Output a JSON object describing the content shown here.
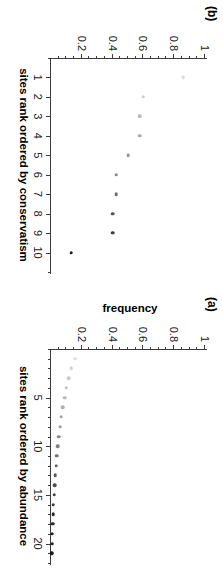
{
  "figure": {
    "orientation_note": "rotated",
    "panels": [
      {
        "tag": "(b)",
        "xlabel": "sites rank ordered by conservatism",
        "ylabel": "",
        "xticks": [
          "1",
          "2",
          "3",
          "4",
          "5",
          "6",
          "7",
          "8",
          "9",
          "10"
        ],
        "yticks": [
          "1",
          "0.8",
          "0.6",
          "0.4",
          "0.2"
        ]
      },
      {
        "tag": "(a)",
        "xlabel": "sites rank ordered by abundance",
        "ylabel": "frequency",
        "xticks": [
          "5",
          "10",
          "15",
          "20"
        ],
        "yticks": [
          "1",
          "0.8",
          "0.6",
          "0.4",
          "0.2"
        ]
      }
    ]
  },
  "chart_data": [
    {
      "type": "scatter",
      "panel": "(a)",
      "title": "",
      "xlabel": "sites rank ordered by abundance",
      "ylabel": "frequency",
      "xlim": [
        0,
        22
      ],
      "ylim": [
        0,
        1
      ],
      "xticks": [
        5,
        10,
        15,
        20
      ],
      "yticks": [
        0.2,
        0.4,
        0.6,
        0.8,
        1
      ],
      "grid": false,
      "legend": null,
      "x": [
        1,
        2,
        3,
        4,
        5,
        6,
        7,
        8,
        9,
        10,
        11,
        12,
        13,
        14,
        15,
        16,
        17,
        18,
        19,
        20,
        21
      ],
      "values": [
        0.158,
        0.132,
        0.115,
        0.1,
        0.088,
        0.077,
        0.067,
        0.058,
        0.05,
        0.043,
        0.037,
        0.032,
        0.027,
        0.023,
        0.019,
        0.016,
        0.013,
        0.011,
        0.009,
        0.007,
        0.005
      ],
      "point_colors": [
        "#d9d9d9",
        "#d2d2d2",
        "#cacaca",
        "#c2c2c2",
        "#b9b9b9",
        "#afafaf",
        "#a4a4a4",
        "#999999",
        "#8d8d8d",
        "#818181",
        "#747474",
        "#676767",
        "#5a5a5a",
        "#4e4e4e",
        "#434343",
        "#393939",
        "#303030",
        "#292929",
        "#232323",
        "#1e1e1e",
        "#1a1a1a"
      ]
    },
    {
      "type": "scatter",
      "panel": "(b)",
      "title": "",
      "xlabel": "sites rank ordered by conservatism",
      "ylabel": "",
      "xlim": [
        0,
        11
      ],
      "ylim": [
        0,
        1
      ],
      "xticks": [
        1,
        2,
        3,
        4,
        5,
        6,
        7,
        8,
        9,
        10
      ],
      "yticks": [
        0.2,
        0.4,
        0.6,
        0.8,
        1
      ],
      "grid": false,
      "legend": null,
      "x": [
        1,
        2,
        3,
        4,
        5,
        6,
        7,
        8,
        9,
        10
      ],
      "values": [
        0.86,
        0.6,
        0.575,
        0.575,
        0.5,
        0.425,
        0.425,
        0.4,
        0.4,
        0.13
      ],
      "point_colors": [
        "#dcdcdc",
        "#cdcdcd",
        "#bdbdbd",
        "#ababab",
        "#989898",
        "#838383",
        "#6d6d6d",
        "#565656",
        "#3d3d3d",
        "#1a1a1a"
      ]
    }
  ]
}
